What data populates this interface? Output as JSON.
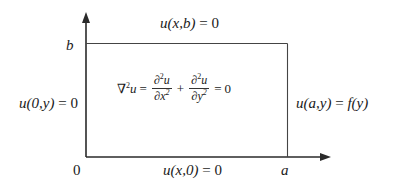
{
  "diagram": {
    "type": "boundary-value-problem-rectangle",
    "axes": {
      "origin_label": "0",
      "x_end_label": "a",
      "y_end_label": "b"
    },
    "boundary_conditions": {
      "top": {
        "lhs": "u(x,b)",
        "rhs": "0"
      },
      "left": {
        "lhs": "u(0,y)",
        "rhs": "0"
      },
      "bottom": {
        "lhs": "u(x,0)",
        "rhs": "0"
      },
      "right": {
        "lhs": "u(a,y)",
        "rhs": "f(y)"
      }
    },
    "equation": {
      "lhs_operator": "∇",
      "lhs_power": "2",
      "lhs_var": "u",
      "term1_num": "∂",
      "term1_num_power": "2",
      "term1_num_var": "u",
      "term1_den": "∂x",
      "term1_den_power": "2",
      "plus": "+",
      "term2_num": "∂",
      "term2_num_power": "2",
      "term2_num_var": "u",
      "term2_den": "∂y",
      "term2_den_power": "2",
      "equals": "=",
      "rhs": "0"
    },
    "colors": {
      "line": "#333333",
      "text": "#1a1a1a",
      "background": "#ffffff"
    }
  }
}
